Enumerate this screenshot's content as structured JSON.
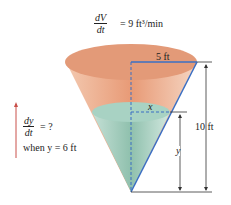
{
  "top_equation": {
    "numerator": "dV",
    "denominator": "dt",
    "rhs": "= 9 ft³/min"
  },
  "question": {
    "numerator": "dy",
    "denominator": "dt",
    "rhs": "= ?",
    "condition": "when y = 6 ft"
  },
  "labels": {
    "radius": "5 ft",
    "height": "10 ft",
    "water_radius": "x",
    "water_height": "y"
  },
  "colors": {
    "cone": "#e8a07c",
    "water": "#9cc9b8",
    "blue_line": "#3a6fc4",
    "arrow": "#c9504a"
  }
}
